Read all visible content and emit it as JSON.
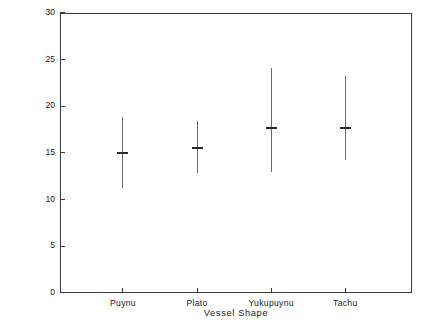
{
  "chart_data": {
    "type": "scatter",
    "title": "",
    "xlabel": "Vessel Shape",
    "ylabel": "Greatest Diameter of Vessel (in cm)",
    "categories": [
      "Puynu",
      "Plato",
      "Yukupuynu",
      "Tachu"
    ],
    "ylim": [
      0,
      30
    ],
    "yticks": [
      0,
      5,
      10,
      15,
      20,
      25,
      30
    ],
    "ytick_labels": [
      "0",
      "5",
      "10",
      "15",
      "20",
      "25",
      "30"
    ],
    "grid": false,
    "legend": "none",
    "series": [
      {
        "name": "Greatest Diameter of Vessel",
        "values": [
          15.1,
          15.6,
          17.8,
          17.8
        ],
        "lower": [
          11.3,
          12.9,
          13.0,
          14.3
        ],
        "upper": [
          18.9,
          18.4,
          24.1,
          23.2
        ]
      }
    ],
    "points": [
      {
        "category": "Puynu",
        "mean": 15.1,
        "low": 11.3,
        "high": 18.9
      },
      {
        "category": "Plato",
        "mean": 15.6,
        "low": 12.9,
        "high": 18.4
      },
      {
        "category": "Yukupuynu",
        "mean": 17.8,
        "low": 13.0,
        "high": 24.1
      },
      {
        "category": "Tachu",
        "mean": 17.8,
        "low": 14.3,
        "high": 23.2
      }
    ],
    "colors": {
      "axis": "#3a3a3a",
      "whisker": "#6a6a6a",
      "mean_marker": "#2b2b2b",
      "background": "#ffffff"
    }
  },
  "caption": {
    "text": ""
  }
}
